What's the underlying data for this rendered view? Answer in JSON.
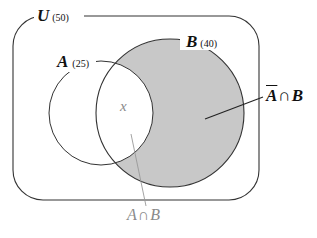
{
  "diagram": {
    "type": "venn",
    "universe": {
      "label": "U",
      "count": "(50)"
    },
    "sets": [
      {
        "label": "A",
        "count": "(25)"
      },
      {
        "label": "B",
        "count": "(40)"
      }
    ],
    "regions": {
      "intersection_value": "x",
      "intersection_label": {
        "left": "A",
        "op": "∩",
        "right": "B"
      },
      "complement_A_and_B_label": {
        "left": "A",
        "op": "∩",
        "right": "B",
        "left_overlined": true
      }
    },
    "colors": {
      "shading": "#c8c8c8",
      "stroke": "#333333",
      "gray_text": "#8a8a8a"
    }
  }
}
